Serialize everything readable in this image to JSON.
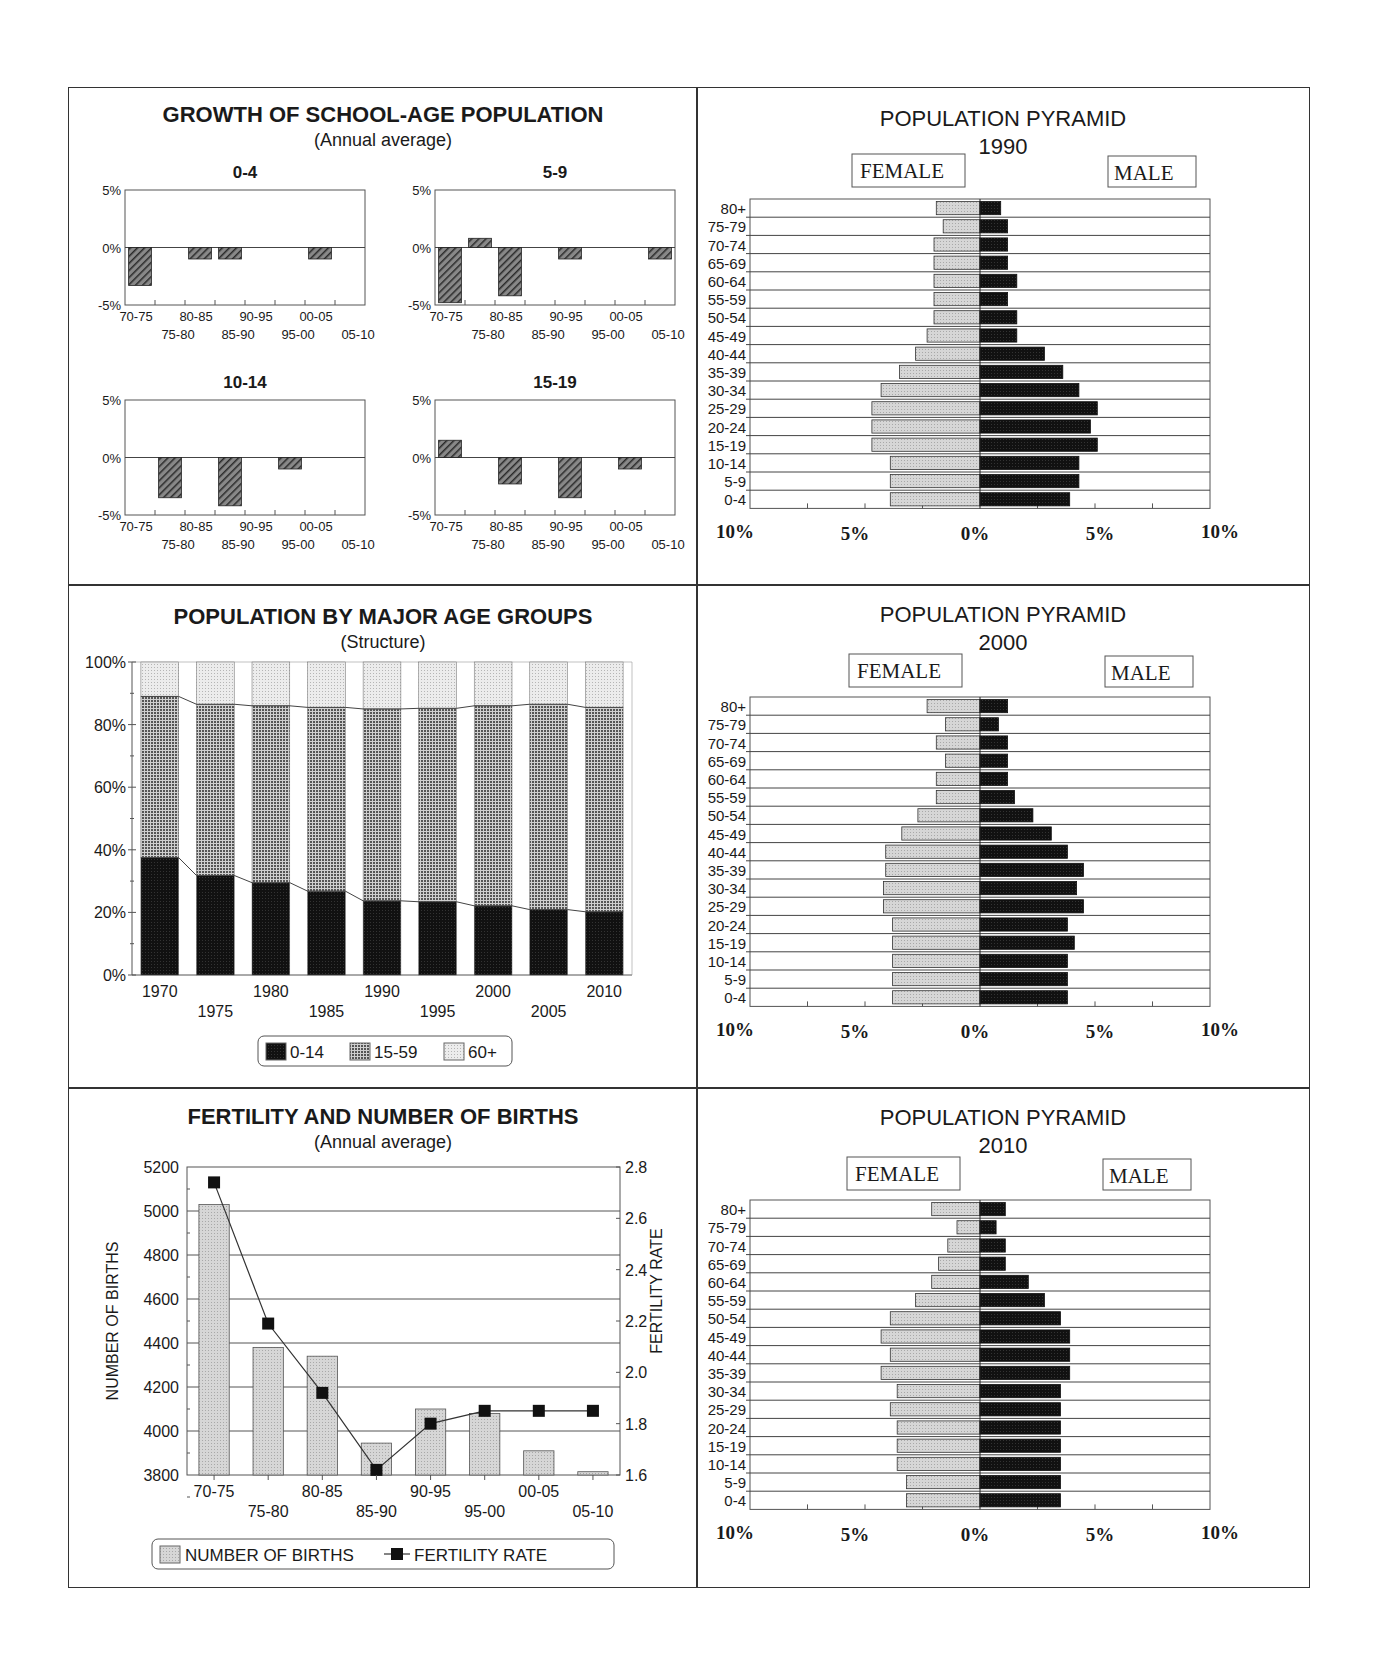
{
  "panels": {
    "growth": {
      "title": "GROWTH OF SCHOOL-AGE POPULATION",
      "subtitle": "(Annual average)"
    },
    "structure": {
      "title": "POPULATION BY MAJOR AGE GROUPS",
      "subtitle": "(Structure)"
    },
    "fertility": {
      "title": "FERTILITY AND NUMBER OF BIRTHS",
      "subtitle": "(Annual average)"
    },
    "pyramid1990": {
      "title": "POPULATION PYRAMID",
      "year": "1990",
      "female_label": "FEMALE",
      "male_label": "MALE"
    },
    "pyramid2000": {
      "title": "POPULATION PYRAMID",
      "year": "2000",
      "female_label": "FEMALE",
      "male_label": "MALE"
    },
    "pyramid2010": {
      "title": "POPULATION PYRAMID",
      "year": "2010",
      "female_label": "FEMALE",
      "male_label": "MALE"
    }
  },
  "colors": {
    "frame": "#333333",
    "dark_bar": "#111111",
    "mid_pattern": "#555555",
    "light_bar": "#d6d6d6",
    "hatch": "#2a2a2a"
  },
  "chart_data": [
    {
      "id": "growth_0_4",
      "type": "bar",
      "title": "0-4",
      "categories": [
        "70-75",
        "75-80",
        "80-85",
        "85-90",
        "90-95",
        "95-00",
        "00-05",
        "05-10"
      ],
      "values": [
        -3.3,
        0,
        -1.0,
        -1.0,
        0,
        0,
        -1.0,
        0
      ],
      "ylim": [
        -5,
        5
      ],
      "yticks": [
        "5%",
        "0%",
        "-5%"
      ],
      "ylabel": "",
      "xlabel": ""
    },
    {
      "id": "growth_5_9",
      "type": "bar",
      "title": "5-9",
      "categories": [
        "70-75",
        "75-80",
        "80-85",
        "85-90",
        "90-95",
        "95-00",
        "00-05",
        "05-10"
      ],
      "values": [
        -4.8,
        0.8,
        -4.2,
        0,
        -1.0,
        0,
        0,
        -1.0
      ],
      "ylim": [
        -5,
        5
      ],
      "yticks": [
        "5%",
        "0%",
        "-5%"
      ]
    },
    {
      "id": "growth_10_14",
      "type": "bar",
      "title": "10-14",
      "categories": [
        "70-75",
        "75-80",
        "80-85",
        "85-90",
        "90-95",
        "95-00",
        "00-05",
        "05-10"
      ],
      "values": [
        0,
        -3.5,
        0,
        -4.2,
        0,
        -1.0,
        0,
        0
      ],
      "ylim": [
        -5,
        5
      ],
      "yticks": [
        "5%",
        "0%",
        "-5%"
      ]
    },
    {
      "id": "growth_15_19",
      "type": "bar",
      "title": "15-19",
      "categories": [
        "70-75",
        "75-80",
        "80-85",
        "85-90",
        "90-95",
        "95-00",
        "00-05",
        "05-10"
      ],
      "values": [
        1.5,
        0,
        -2.3,
        0,
        -3.5,
        0,
        -1.0,
        0
      ],
      "ylim": [
        -5,
        5
      ],
      "yticks": [
        "5%",
        "0%",
        "-5%"
      ]
    },
    {
      "id": "structure",
      "type": "bar",
      "stacked": true,
      "title": "POPULATION BY MAJOR AGE GROUPS",
      "subtitle": "(Structure)",
      "categories": [
        "1970",
        "1975",
        "1980",
        "1985",
        "1990",
        "1995",
        "2000",
        "2005",
        "2010"
      ],
      "series": [
        {
          "name": "0-14",
          "values": [
            37.5,
            31.8,
            29.5,
            26.8,
            23.7,
            23.4,
            22.1,
            20.9,
            20.2
          ]
        },
        {
          "name": "15-59",
          "values": [
            51.5,
            54.7,
            56.5,
            58.7,
            61.3,
            61.8,
            63.9,
            65.6,
            65.3
          ]
        },
        {
          "name": "60+",
          "values": [
            11.0,
            13.5,
            14.0,
            14.5,
            15.0,
            14.8,
            14.0,
            13.5,
            14.5
          ]
        }
      ],
      "ylim": [
        0,
        100
      ],
      "yticks": [
        "0%",
        "20%",
        "40%",
        "60%",
        "80%",
        "100%"
      ],
      "legend": [
        "0-14",
        "15-59",
        "60+"
      ],
      "legend_position": "bottom"
    },
    {
      "id": "fertility",
      "type": "bar",
      "title": "FERTILITY AND NUMBER OF BIRTHS",
      "subtitle": "(Annual average)",
      "categories": [
        "70-75",
        "75-80",
        "80-85",
        "85-90",
        "90-95",
        "95-00",
        "00-05",
        "05-10"
      ],
      "series": [
        {
          "name": "NUMBER OF BIRTHS",
          "type": "bar",
          "axis": "left",
          "values": [
            5030,
            4380,
            4340,
            3945,
            4100,
            4080,
            3910,
            3815
          ]
        },
        {
          "name": "FERTILITY RATE",
          "type": "line",
          "axis": "right",
          "values": [
            2.74,
            2.19,
            1.92,
            1.62,
            1.8,
            1.85,
            1.85,
            1.85
          ]
        }
      ],
      "ylabel": "NUMBER OF BIRTHS",
      "ylabel_right": "FERTILITY RATE",
      "ylim": [
        3800,
        5200
      ],
      "ylim_right": [
        1.6,
        2.8
      ],
      "yticks": [
        "3800",
        "4000",
        "4200",
        "4400",
        "4600",
        "4800",
        "5000",
        "5200"
      ],
      "yticks_right": [
        "1.6",
        "1.8",
        "2.0",
        "2.2",
        "2.4",
        "2.6",
        "2.8"
      ],
      "grid": true,
      "legend": [
        "NUMBER OF BIRTHS",
        "FERTILITY RATE"
      ],
      "legend_position": "bottom"
    },
    {
      "id": "pyramid1990",
      "type": "bar",
      "orientation": "horizontal",
      "title": "POPULATION PYRAMID 1990",
      "categories": [
        "80+",
        "75-79",
        "70-74",
        "65-69",
        "60-64",
        "55-59",
        "50-54",
        "45-49",
        "40-44",
        "35-39",
        "30-34",
        "25-29",
        "20-24",
        "15-19",
        "10-14",
        "5-9",
        "0-4"
      ],
      "series": [
        {
          "name": "FEMALE",
          "values": [
            1.9,
            1.6,
            2.0,
            2.0,
            2.0,
            2.0,
            2.0,
            2.3,
            2.8,
            3.5,
            4.3,
            4.7,
            4.7,
            4.7,
            3.9,
            3.9,
            3.9
          ]
        },
        {
          "name": "MALE",
          "values": [
            0.9,
            1.2,
            1.2,
            1.2,
            1.6,
            1.2,
            1.6,
            1.6,
            2.8,
            3.6,
            4.3,
            5.1,
            4.8,
            5.1,
            4.3,
            4.3,
            3.9
          ]
        }
      ],
      "xticks": [
        "10%",
        "5%",
        "0%",
        "5%",
        "10%"
      ],
      "xlim": [
        -10,
        10
      ]
    },
    {
      "id": "pyramid2000",
      "type": "bar",
      "orientation": "horizontal",
      "title": "POPULATION PYRAMID 2000",
      "categories": [
        "80+",
        "75-79",
        "70-74",
        "65-69",
        "60-64",
        "55-59",
        "50-54",
        "45-49",
        "40-44",
        "35-39",
        "30-34",
        "25-29",
        "20-24",
        "15-19",
        "10-14",
        "5-9",
        "0-4"
      ],
      "series": [
        {
          "name": "FEMALE",
          "values": [
            2.3,
            1.5,
            1.9,
            1.5,
            1.9,
            1.9,
            2.7,
            3.4,
            4.1,
            4.1,
            4.2,
            4.2,
            3.8,
            3.8,
            3.8,
            3.8,
            3.8
          ]
        },
        {
          "name": "MALE",
          "values": [
            1.2,
            0.8,
            1.2,
            1.2,
            1.2,
            1.5,
            2.3,
            3.1,
            3.8,
            4.5,
            4.2,
            4.5,
            3.8,
            4.1,
            3.8,
            3.8,
            3.8
          ]
        }
      ],
      "xticks": [
        "10%",
        "5%",
        "0%",
        "5%",
        "10%"
      ],
      "xlim": [
        -10,
        10
      ]
    },
    {
      "id": "pyramid2010",
      "type": "bar",
      "orientation": "horizontal",
      "title": "POPULATION PYRAMID 2010",
      "categories": [
        "80+",
        "75-79",
        "70-74",
        "65-69",
        "60-64",
        "55-59",
        "50-54",
        "45-49",
        "40-44",
        "35-39",
        "30-34",
        "25-29",
        "20-24",
        "15-19",
        "10-14",
        "5-9",
        "0-4"
      ],
      "series": [
        {
          "name": "FEMALE",
          "values": [
            2.1,
            1.0,
            1.4,
            1.8,
            2.1,
            2.8,
            3.9,
            4.3,
            3.9,
            4.3,
            3.6,
            3.9,
            3.6,
            3.6,
            3.6,
            3.2,
            3.2
          ]
        },
        {
          "name": "MALE",
          "values": [
            1.1,
            0.7,
            1.1,
            1.1,
            2.1,
            2.8,
            3.5,
            3.9,
            3.9,
            3.9,
            3.5,
            3.5,
            3.5,
            3.5,
            3.5,
            3.5,
            3.5
          ]
        }
      ],
      "xticks": [
        "10%",
        "5%",
        "0%",
        "5%",
        "10%"
      ],
      "xlim": [
        -10,
        10
      ]
    }
  ]
}
